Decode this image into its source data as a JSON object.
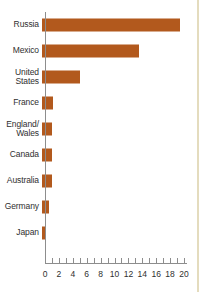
{
  "chart_data": {
    "type": "bar",
    "orientation": "horizontal",
    "title": "",
    "subtitle": "",
    "xlabel": "",
    "ylabel": "",
    "categories": [
      "Russia",
      "Mexico",
      "United States",
      "France",
      "England/ Wales",
      "Canada",
      "Australia",
      "Germany",
      "Japan"
    ],
    "category_labels_display": [
      "Russia",
      "Mexico",
      "United\nStates",
      "France",
      "England/\nWales",
      "Canada",
      "Australia",
      "Germany",
      "Japan"
    ],
    "values": [
      19.9,
      14.0,
      5.5,
      1.6,
      1.5,
      1.5,
      1.4,
      1.0,
      0.4
    ],
    "xlim": [
      0,
      20
    ],
    "tick_values": [
      0,
      1,
      2,
      3,
      4,
      5,
      6,
      7,
      8,
      9,
      10,
      11,
      12,
      13,
      14,
      15,
      16,
      17,
      18,
      19,
      20
    ],
    "tick_labels": [
      "0",
      "2",
      "4",
      "6",
      "8",
      "10",
      "12",
      "14",
      "16",
      "18",
      "20"
    ],
    "labeled_ticks": [
      0,
      2,
      4,
      6,
      8,
      10,
      12,
      14,
      16,
      18,
      20
    ],
    "grid": false,
    "legend": null,
    "colors": {
      "bar": "#b2591d",
      "axis": "#8d8d8d",
      "text": "#2f2f2f",
      "background": "#ffffff",
      "page_edge_rule": "#e4dcbe"
    }
  },
  "layout": {
    "axis_left_px": 45,
    "axis_bottom_px": 263,
    "px_per_unit": 6.95,
    "row_height_px": 26,
    "first_row_top_px": 12,
    "page_edge_rule_left_px": 197
  }
}
